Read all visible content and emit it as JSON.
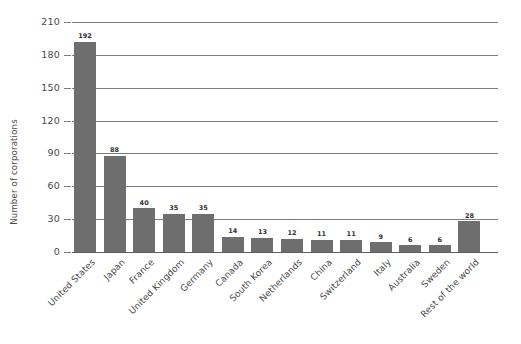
{
  "chart_data": {
    "type": "bar",
    "title": "",
    "xlabel": "",
    "ylabel": "Number of corporations",
    "ylim": [
      0,
      210
    ],
    "yticks": [
      0,
      30,
      60,
      90,
      120,
      150,
      180,
      210
    ],
    "grid": true,
    "legend": "none",
    "bar_color": "#6e6e6e",
    "gridline_color": "#7d7d7d",
    "categories": [
      "United States",
      "Japan",
      "France",
      "United Kingdom",
      "Germany",
      "Canada",
      "South Korea",
      "Netherlands",
      "China",
      "Switzerland",
      "Italy",
      "Australia",
      "Sweden",
      "Rest of the world"
    ],
    "values": [
      192,
      88,
      40,
      35,
      35,
      14,
      13,
      12,
      11,
      11,
      9,
      6,
      6,
      28
    ],
    "data_labels": [
      "192",
      "88",
      "40",
      "35",
      "35",
      "14",
      "13",
      "12",
      "11",
      "11",
      "9",
      "6",
      "6",
      "28"
    ],
    "ytick_labels": [
      "0",
      "30",
      "60",
      "90",
      "120",
      "150",
      "180",
      "210"
    ]
  }
}
